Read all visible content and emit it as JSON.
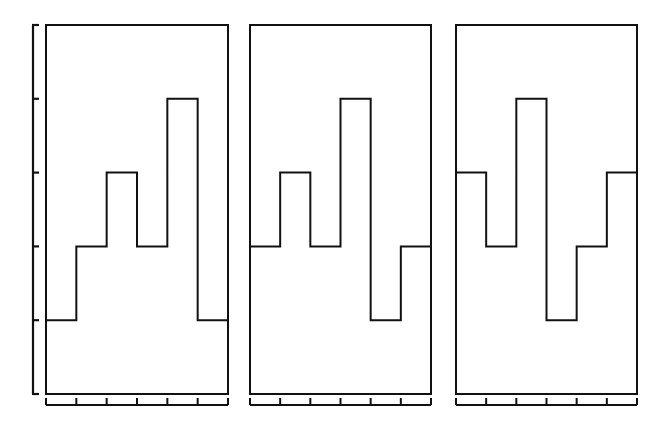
{
  "chart_data": {
    "type": "step",
    "title": "",
    "xlabel": "",
    "ylabel": "",
    "ylim": [
      0,
      5
    ],
    "y_ticks": [
      0,
      1,
      2,
      3,
      4,
      5
    ],
    "y_tick_labels": [],
    "x_tick_labels": [],
    "grid": false,
    "legend": null,
    "bins_per_panel": 6,
    "panels": [
      {
        "name": "panel-1",
        "values": [
          1,
          2,
          3,
          2,
          4,
          1
        ]
      },
      {
        "name": "panel-2",
        "values": [
          2,
          3,
          2,
          4,
          1,
          2
        ]
      },
      {
        "name": "panel-3",
        "values": [
          3,
          2,
          4,
          1,
          2,
          3
        ]
      }
    ]
  },
  "style": {
    "line_color": "#111111",
    "background": "#ffffff"
  }
}
